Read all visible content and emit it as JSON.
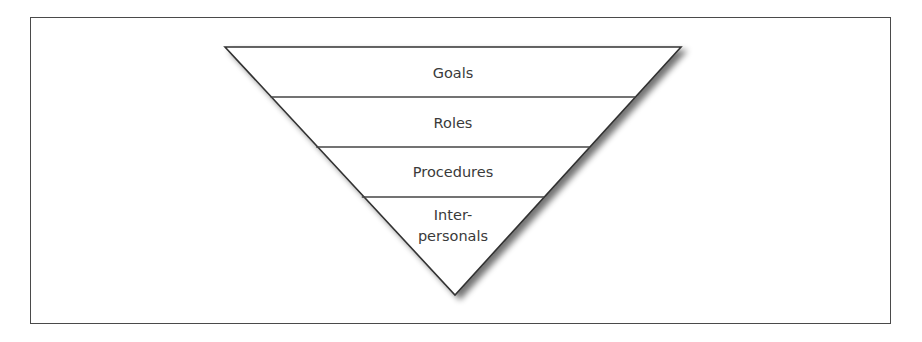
{
  "diagram": {
    "type": "inverted-pyramid",
    "colors": {
      "stroke": "#333333",
      "fill": "#ffffff",
      "text": "#3a3a3a",
      "frame": "#4a4a4a"
    },
    "layers": [
      {
        "label": "Goals"
      },
      {
        "label": "Roles"
      },
      {
        "label": "Procedures"
      },
      {
        "label_line1": "Inter-",
        "label_line2": "personals"
      }
    ]
  }
}
